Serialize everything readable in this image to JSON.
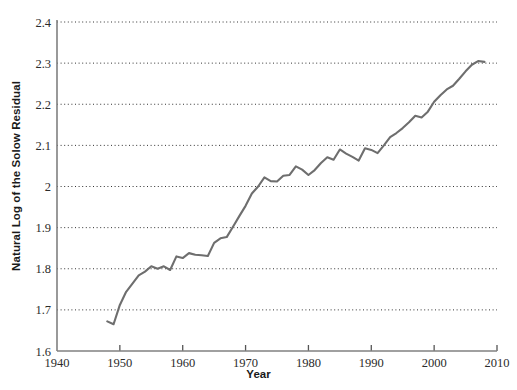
{
  "chart_data": {
    "type": "line",
    "title": "",
    "xlabel": "Year",
    "ylabel": "Natural Log of the Solow Residual",
    "xlim": [
      1940,
      2010
    ],
    "ylim": [
      1.6,
      2.4
    ],
    "xticks": [
      "1940",
      "1950",
      "1960",
      "1970",
      "1980",
      "1990",
      "2000",
      "2010"
    ],
    "yticks": [
      "1.6",
      "1.7",
      "1.8",
      "1.9",
      "2",
      "2.1",
      "2.2",
      "2.3",
      "2.4"
    ],
    "grid": "horizontal-dotted",
    "legend": "none",
    "line_color": "#6e6e6e",
    "series": [
      {
        "name": "Natural Log of the Solow Residual",
        "x": [
          1948,
          1949,
          1950,
          1951,
          1952,
          1953,
          1954,
          1955,
          1956,
          1957,
          1958,
          1959,
          1960,
          1961,
          1962,
          1963,
          1964,
          1965,
          1966,
          1967,
          1968,
          1969,
          1970,
          1971,
          1972,
          1973,
          1974,
          1975,
          1976,
          1977,
          1978,
          1979,
          1980,
          1981,
          1982,
          1983,
          1984,
          1985,
          1986,
          1987,
          1988,
          1989,
          1990,
          1991,
          1992,
          1993,
          1994,
          1995,
          1996,
          1997,
          1998,
          1999,
          2000,
          2001
        ],
        "values": [
          1.672,
          1.665,
          1.712,
          1.744,
          1.764,
          1.784,
          1.793,
          1.806,
          1.8,
          1.806,
          1.797,
          1.83,
          1.826,
          1.838,
          1.834,
          1.833,
          1.831,
          1.863,
          1.874,
          1.877,
          1.902,
          1.928,
          1.953,
          1.983,
          2.0,
          2.022,
          2.013,
          2.012,
          2.026,
          2.028,
          2.049,
          2.041,
          2.028,
          2.04,
          2.057,
          2.071,
          2.065,
          2.09,
          2.08,
          2.072,
          2.063,
          2.093,
          2.089,
          2.081,
          2.1,
          2.12,
          2.13,
          2.142,
          2.156,
          2.172,
          2.168,
          2.182,
          2.206,
          2.222
        ],
        "values_extended": [
          2.236,
          2.245,
          2.262,
          2.28,
          2.296,
          2.305,
          2.303
        ]
      }
    ]
  },
  "axis": {
    "y_title": "Natural Log of the Solow Residual",
    "x_title": "Year"
  }
}
